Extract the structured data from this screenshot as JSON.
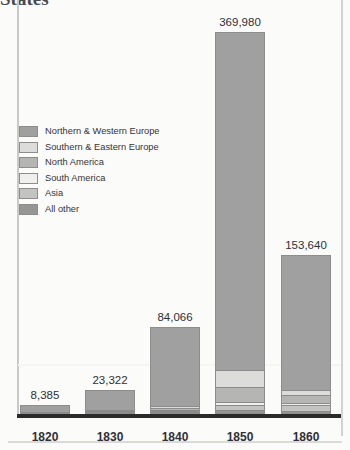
{
  "title": "States",
  "legend": {
    "items": [
      {
        "label": "Northern & Western Europe",
        "color": "#a0a0a0",
        "key": "northern-western-europe"
      },
      {
        "label": "Southern & Eastern Europe",
        "color": "#dcdcda",
        "key": "southern-eastern-europe"
      },
      {
        "label": "North America",
        "color": "#b5b5b3",
        "key": "north-america"
      },
      {
        "label": "South America",
        "color": "#efefee",
        "key": "south-america"
      },
      {
        "label": "Asia",
        "color": "#c3c3c1",
        "key": "asia"
      },
      {
        "label": "All other",
        "color": "#969694",
        "key": "all-other"
      }
    ]
  },
  "chart_data": {
    "type": "bar",
    "subtype": "stacked",
    "title": "States",
    "xlabel": "",
    "ylabel": "",
    "grid": true,
    "legend_position": "inside-upper-left",
    "ylim": [
      0,
      385000
    ],
    "categories": [
      "1820",
      "1830",
      "1840",
      "1850",
      "1860"
    ],
    "totals": [
      8385,
      23322,
      84066,
      369980,
      153640
    ],
    "total_labels": [
      "8,385",
      "23,322",
      "84,066",
      "369,980",
      "153,640"
    ],
    "series": [
      {
        "name": "Northern & Western Europe",
        "color": "#a0a0a0",
        "values": [
          6800,
          19500,
          76500,
          327000,
          130000
        ]
      },
      {
        "name": "Southern & Eastern Europe",
        "color": "#dcdcda",
        "values": [
          300,
          700,
          1400,
          17000,
          4800
        ]
      },
      {
        "name": "North America",
        "color": "#b5b5b3",
        "values": [
          420,
          1200,
          2600,
          14000,
          8200
        ]
      },
      {
        "name": "South America",
        "color": "#efefee",
        "values": [
          180,
          400,
          900,
          3500,
          2200
        ]
      },
      {
        "name": "Asia",
        "color": "#c3c3c1",
        "values": [
          85,
          222,
          666,
          4480,
          5640
        ]
      },
      {
        "name": "All other",
        "color": "#969694",
        "values": [
          600,
          1300,
          2000,
          4000,
          2800
        ]
      }
    ]
  },
  "axis": {
    "tick_labels": [
      "1820",
      "1830",
      "1840",
      "1850",
      "1860"
    ]
  }
}
